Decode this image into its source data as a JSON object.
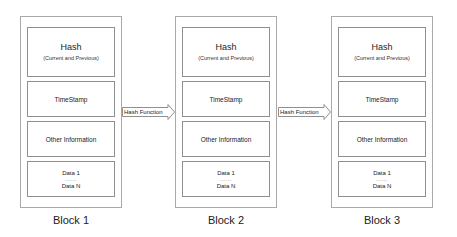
{
  "diagram": {
    "blocks": [
      {
        "label": "Block 1",
        "hash_title": "Hash",
        "hash_subtitle": "(Current and Previous)",
        "timestamp": "TimeStamp",
        "other": "Other Information",
        "data_first": "Data 1",
        "data_ellipsis": "......",
        "data_last": "Data N"
      },
      {
        "label": "Block 2",
        "hash_title": "Hash",
        "hash_subtitle": "(Current and Previous)",
        "timestamp": "TimeStamp",
        "other": "Other Information",
        "data_first": "Data 1",
        "data_ellipsis": "......",
        "data_last": "Data N"
      },
      {
        "label": "Block 3",
        "hash_title": "Hash",
        "hash_subtitle": "(Current and Previous)",
        "timestamp": "TimeStamp",
        "other": "Other Information",
        "data_first": "Data 1",
        "data_ellipsis": "......",
        "data_last": "Data N"
      }
    ],
    "arrows": [
      {
        "label": "Hash Function",
        "from": "Block 1",
        "to": "Block 2"
      },
      {
        "label": "Hash Function",
        "from": "Block 2",
        "to": "Block 3"
      }
    ],
    "colors": {
      "border": "#a9a9a9",
      "section_border": "#8f8f8f",
      "text": "#222222",
      "background": "#ffffff"
    }
  }
}
